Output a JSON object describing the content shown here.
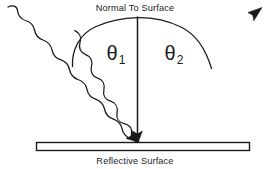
{
  "diagram": {
    "title_top": "Normal To Surface",
    "title_bottom": "Reflective Surface",
    "angle_incidence": "θ",
    "angle_incidence_sub": "1",
    "angle_reflection": "θ",
    "angle_reflection_sub": "2",
    "ink_color": "#1b1b1b",
    "background_color": "#ffffff"
  },
  "elements": {
    "normal_line_name": "normal-to-surface-line",
    "incident_ray_name": "incident-wavy-ray",
    "reflected_ray_name": "reflected-wavy-ray",
    "arc_name": "angle-arc",
    "surface_name": "reflective-surface-bar"
  }
}
